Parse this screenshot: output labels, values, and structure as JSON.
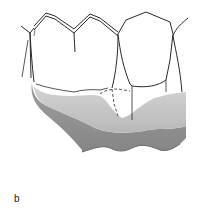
{
  "figure": {
    "panel_label": "b",
    "colors": {
      "outline": "#2a2a2a",
      "base_light": "#c8c8c8",
      "base_mid": "#b3b3b3",
      "base_dark": "#8c8c8c",
      "background": "#ffffff"
    },
    "elements": [
      {
        "name": "molar-crown-left",
        "type": "tooth"
      },
      {
        "name": "molar-crown-middle",
        "type": "tooth"
      },
      {
        "name": "tooth-right",
        "type": "tooth"
      },
      {
        "name": "dashed-margin-line",
        "type": "hidden-outline"
      },
      {
        "name": "gingival-base",
        "type": "base"
      }
    ]
  }
}
